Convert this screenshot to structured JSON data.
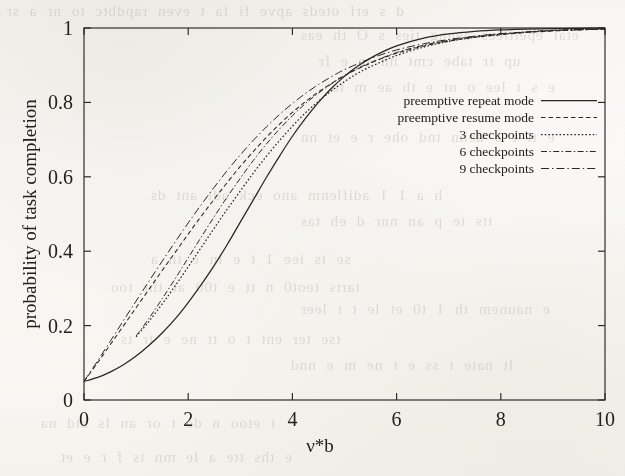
{
  "figure": {
    "background_color": "#fbfaf7",
    "ink_color": "#2a2622",
    "frame": {
      "left": 84,
      "top": 28,
      "right": 605,
      "bottom": 400
    }
  },
  "bleed_through": {
    "note": "faint mirrored text showing through the scanned page",
    "lines": [
      "d s erf oteds apve  fi  fa  t  even  rapdbtc to  nr  a  sr",
      "etal  epettiecs  aenng ties  s  O  th  eas",
      "up  tr tabe  cmt  nn  te  e  fr",
      "e  s  t  lee  o  nt  e  th  ae  m  to",
      "e  ti t  a  denn  tnd  ohe  r  e  et  nn",
      "h  a  1 1 adiflenm  ano  eck  adt  ant  ds",
      "tts  te  p  an  nnr   d  eh  tas",
      "se  ts  iee  1  t  e  in  e  tn  a",
      "tarts  teot0  n  tt  e  t00  at  thr  too",
      "e  naunem  th  1  t0  et  le  t  t  leer",
      "tse ter  ent  t  o  tt  ne  e  tr  ts",
      "lt  nate  t  ss  e  t  ne  m  e  nnd",
      "t  etoo  n  de  t  or  an  ls  atd  na",
      "e  ths  tte  a  le  mn  ts  f  r  e  et"
    ]
  },
  "chart_data": {
    "type": "line",
    "title": "",
    "xlabel": "ν*b",
    "ylabel": "probability of task completion",
    "xlim": [
      0,
      10
    ],
    "ylim": [
      0,
      1
    ],
    "xticks": [
      "0",
      "2",
      "4",
      "6",
      "8",
      "10"
    ],
    "xtick_values": [
      0,
      2,
      4,
      6,
      8,
      10
    ],
    "yticks": [
      "0",
      "0.2",
      "0.4",
      "0.6",
      "0.8",
      "1"
    ],
    "ytick_values": [
      0,
      0.2,
      0.4,
      0.6,
      0.8,
      1
    ],
    "grid": false,
    "legend_position": "upper right (inside plot)",
    "series": [
      {
        "name": "preemptive repeat mode",
        "style": "solid",
        "dasharray": "",
        "width": 1.25,
        "x": [
          0,
          0.25,
          0.5,
          0.75,
          1.0,
          1.25,
          1.5,
          1.75,
          2.0,
          2.25,
          2.5,
          2.75,
          3.0,
          3.25,
          3.5,
          3.75,
          4.0,
          4.25,
          4.5,
          4.75,
          5.0,
          5.25,
          5.5,
          5.75,
          6.0,
          6.5,
          7.0,
          7.5,
          8.0,
          8.5,
          9.0,
          9.5,
          10.0
        ],
        "y": [
          0.05,
          0.06,
          0.075,
          0.094,
          0.118,
          0.147,
          0.18,
          0.218,
          0.262,
          0.31,
          0.362,
          0.418,
          0.478,
          0.538,
          0.598,
          0.655,
          0.709,
          0.757,
          0.8,
          0.838,
          0.87,
          0.897,
          0.919,
          0.937,
          0.952,
          0.972,
          0.984,
          0.991,
          0.995,
          0.997,
          0.998,
          0.999,
          1.0
        ]
      },
      {
        "name": "preemptive resume mode",
        "style": "dashed",
        "dasharray": "4.5,3",
        "width": 1.05,
        "x": [
          0,
          0.25,
          0.5,
          0.75,
          1.0,
          1.25,
          1.5,
          1.75,
          2.0,
          2.25,
          2.5,
          2.75,
          3.0,
          3.25,
          3.5,
          3.75,
          4.0,
          4.25,
          4.5,
          4.75,
          5.0,
          5.5,
          6.0,
          6.5,
          7.0,
          7.5,
          8.0,
          8.5,
          9.0,
          9.5,
          10.0
        ],
        "y": [
          0.05,
          0.098,
          0.148,
          0.198,
          0.248,
          0.298,
          0.348,
          0.397,
          0.446,
          0.494,
          0.54,
          0.585,
          0.628,
          0.668,
          0.706,
          0.741,
          0.773,
          0.802,
          0.828,
          0.851,
          0.872,
          0.906,
          0.932,
          0.951,
          0.965,
          0.975,
          0.982,
          0.988,
          0.992,
          0.995,
          0.997
        ]
      },
      {
        "name": "3 checkpoints",
        "style": "fine-dotted",
        "dasharray": "1.6,2.1",
        "width": 1.25,
        "x": [
          1.0,
          1.25,
          1.5,
          1.75,
          2.0,
          2.25,
          2.5,
          2.75,
          3.0,
          3.25,
          3.5,
          3.75,
          4.0,
          4.25,
          4.5,
          4.75,
          5.0,
          5.25,
          5.5,
          6.0,
          6.5,
          7.0,
          7.5,
          8.0,
          8.5,
          9.0,
          9.5,
          10.0
        ],
        "y": [
          0.17,
          0.212,
          0.258,
          0.307,
          0.358,
          0.41,
          0.462,
          0.513,
          0.562,
          0.61,
          0.655,
          0.697,
          0.736,
          0.772,
          0.803,
          0.831,
          0.856,
          0.878,
          0.896,
          0.926,
          0.948,
          0.964,
          0.975,
          0.983,
          0.989,
          0.993,
          0.996,
          0.998
        ]
      },
      {
        "name": "6 checkpoints",
        "style": "dash-dot",
        "dasharray": "6,2.4,1.4,2.4",
        "width": 1.0,
        "x": [
          1.0,
          1.25,
          1.5,
          1.75,
          2.0,
          2.25,
          2.5,
          2.75,
          3.0,
          3.25,
          3.5,
          3.75,
          4.0,
          4.25,
          4.5,
          4.75,
          5.0,
          5.25,
          5.5,
          6.0,
          6.5,
          7.0,
          7.5,
          8.0,
          8.5,
          9.0,
          9.5,
          10.0
        ],
        "y": [
          0.172,
          0.22,
          0.272,
          0.326,
          0.382,
          0.438,
          0.493,
          0.546,
          0.596,
          0.644,
          0.688,
          0.728,
          0.764,
          0.797,
          0.825,
          0.85,
          0.872,
          0.891,
          0.907,
          0.934,
          0.953,
          0.967,
          0.977,
          0.984,
          0.99,
          0.994,
          0.996,
          0.998
        ]
      },
      {
        "name": "9 checkpoints",
        "style": "long-dash-dot",
        "dasharray": "8,3,1.4,3",
        "width": 1.0,
        "x": [
          0,
          0.25,
          0.5,
          0.75,
          1.0,
          1.25,
          1.5,
          1.75,
          2.0,
          2.25,
          2.5,
          2.75,
          3.0,
          3.25,
          3.5,
          3.75,
          4.0,
          4.25,
          4.5,
          4.75,
          5.0,
          5.5,
          6.0,
          6.5,
          7.0,
          7.5,
          8.0,
          8.5,
          9.0,
          9.5,
          10.0
        ],
        "y": [
          0.05,
          0.103,
          0.157,
          0.212,
          0.266,
          0.32,
          0.373,
          0.425,
          0.476,
          0.525,
          0.572,
          0.617,
          0.659,
          0.698,
          0.734,
          0.767,
          0.797,
          0.824,
          0.848,
          0.869,
          0.888,
          0.918,
          0.941,
          0.957,
          0.969,
          0.978,
          0.985,
          0.989,
          0.993,
          0.995,
          0.997
        ]
      }
    ]
  },
  "legend": {
    "entries": [
      {
        "label": "preemptive repeat mode",
        "style": "solid"
      },
      {
        "label": "preemptive resume mode",
        "style": "dashed"
      },
      {
        "label": "3 checkpoints",
        "style": "fine-dotted"
      },
      {
        "label": "6 checkpoints",
        "style": "dash-dot"
      },
      {
        "label": "9 checkpoints",
        "style": "long-dash-dot"
      }
    ]
  }
}
